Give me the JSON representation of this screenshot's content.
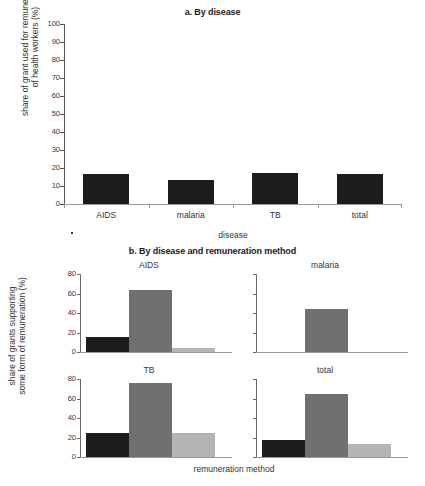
{
  "chart_data": [
    {
      "type": "bar",
      "id": "panel-a",
      "title": "a. By disease",
      "xlabel": "disease",
      "ylabel_line1": "share of grant used for remuneration",
      "ylabel_line2": "of health workers (%)",
      "categories": [
        "AIDS",
        "malaria",
        "TB",
        "total"
      ],
      "values": [
        16.5,
        13.5,
        17.5,
        16.5
      ],
      "ylim": [
        0,
        100
      ],
      "yticks": [
        0,
        10,
        20,
        30,
        40,
        50,
        60,
        70,
        80,
        90,
        100
      ],
      "grid": false,
      "legend": "none",
      "bar_color": "#1c1c1c"
    },
    {
      "type": "bar",
      "id": "panel-b",
      "title": "b. By disease and remuneration method",
      "xlabel": "remuneration method",
      "ylabel_line1": "share of grants supporting",
      "ylabel_line2": "some form of remuneration (%)",
      "ylim": [
        0,
        80
      ],
      "yticks": [
        0,
        20,
        40,
        60,
        80
      ],
      "grid": false,
      "legend": "none",
      "series_colors": [
        "#1c1c1c",
        "#707070",
        "#b4b4b4"
      ],
      "subplots": [
        {
          "title": "AIDS",
          "values": [
            15,
            64,
            4
          ]
        },
        {
          "title": "malaria",
          "values": [
            0,
            44,
            0
          ]
        },
        {
          "title": "TB",
          "values": [
            25,
            76,
            25
          ]
        },
        {
          "title": "total",
          "values": [
            17,
            65,
            13
          ]
        }
      ]
    }
  ]
}
